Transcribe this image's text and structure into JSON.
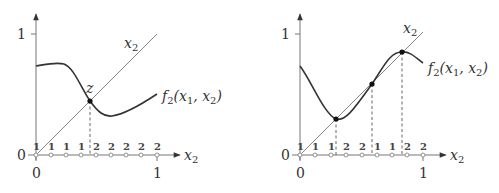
{
  "panels": [
    {
      "id": "left",
      "y_axis": {
        "tick_top": "1",
        "tick_origin": "0"
      },
      "x_axis": {
        "tick_left": "0",
        "tick_right": "1",
        "label": "x",
        "label_sub": "2"
      },
      "diagonal_label": {
        "main": "x",
        "sub": "2"
      },
      "curve_label": {
        "f": "f",
        "f_sub": "2",
        "args_open": "(x",
        "arg1_sub": "1",
        "comma": ", x",
        "arg2_sub": "2",
        "close": ")"
      },
      "fixed_point_label": "z",
      "strategy_labels": [
        "1",
        "1",
        "1",
        "1",
        "2",
        "2",
        "2",
        "2",
        "2"
      ]
    },
    {
      "id": "right",
      "y_axis": {
        "tick_top": "1",
        "tick_origin": "0"
      },
      "x_axis": {
        "tick_left": "0",
        "tick_right": "1",
        "label": "x",
        "label_sub": "2"
      },
      "diagonal_label": {
        "main": "x",
        "sub": "2"
      },
      "curve_label": {
        "f": "f",
        "f_sub": "2",
        "args_open": "(x",
        "arg1_sub": "1",
        "comma": ", x",
        "arg2_sub": "2",
        "close": ")"
      },
      "strategy_labels": [
        "1",
        "1",
        "1",
        "2",
        "2",
        "1",
        "1",
        "2",
        "2"
      ]
    }
  ]
}
